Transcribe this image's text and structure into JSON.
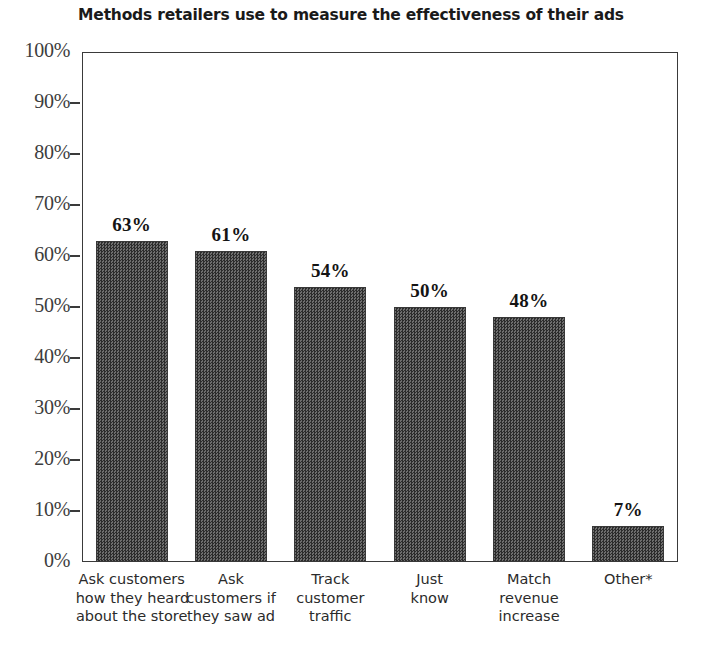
{
  "chart_data": {
    "type": "bar",
    "title": "Methods retailers use to measure the effectiveness of their ads",
    "xlabel": "",
    "ylabel": "",
    "ylim": [
      0,
      100
    ],
    "grid": false,
    "legend": "none",
    "categories": [
      "Ask customers how they heard about the store",
      "Ask customers if they saw ad",
      "Track customer traffic",
      "Just know",
      "Match revenue increase",
      "Other*"
    ],
    "category_lines": [
      [
        "Ask customers",
        "how they heard",
        "about the store"
      ],
      [
        "Ask",
        "customers if",
        "they saw ad"
      ],
      [
        "Track",
        "customer",
        "traffic"
      ],
      [
        "Just",
        "know"
      ],
      [
        "Match",
        "revenue",
        "increase"
      ],
      [
        "Other*"
      ]
    ],
    "values": [
      63,
      61,
      54,
      50,
      48,
      7
    ],
    "value_labels": [
      "63%",
      "61%",
      "54%",
      "50%",
      "48%",
      "7%"
    ],
    "ytick_values": [
      100,
      90,
      80,
      70,
      60,
      50,
      40,
      30,
      20,
      10,
      0
    ],
    "ytick_labels": [
      "100%",
      "90%",
      "80%",
      "70%",
      "60%",
      "50%",
      "40%",
      "30%",
      "20%",
      "10%",
      "0%"
    ],
    "bar_color": "#4f4f4f",
    "axis_color": "#3a3a3a",
    "background": "#ffffff"
  },
  "footnote": {
    "text": ""
  }
}
